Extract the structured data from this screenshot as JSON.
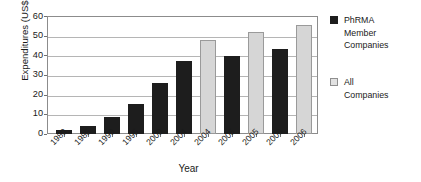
{
  "chart_data": {
    "type": "bar",
    "title": "",
    "xlabel": "Year",
    "ylabel": "Expenditures (US$ billions)",
    "ylim": [
      0,
      60
    ],
    "yticks": [
      0,
      10,
      20,
      30,
      40,
      50,
      60
    ],
    "grid": true,
    "legend_position": "right",
    "categories": [
      "1980",
      "1985",
      "1990",
      "1995",
      "2000",
      "2004",
      "2004",
      "2005",
      "2005",
      "2006",
      "2006"
    ],
    "values": [
      2.0,
      4.0,
      8.5,
      15.5,
      26.0,
      37.0,
      47.6,
      39.9,
      51.8,
      43.0,
      55.2
    ],
    "series_of_bar": [
      "PhRMA Member Companies",
      "PhRMA Member Companies",
      "PhRMA Member Companies",
      "PhRMA Member Companies",
      "PhRMA Member Companies",
      "PhRMA Member Companies",
      "All Companies",
      "PhRMA Member Companies",
      "All Companies",
      "PhRMA Member Companies",
      "All Companies"
    ],
    "series": [
      {
        "name": "PhRMA Member Companies",
        "color": "#1d1d1d",
        "points": [
          {
            "x": "1980",
            "y": 2.0
          },
          {
            "x": "1985",
            "y": 4.0
          },
          {
            "x": "1990",
            "y": 8.5
          },
          {
            "x": "1995",
            "y": 15.5
          },
          {
            "x": "2000",
            "y": 26.0
          },
          {
            "x": "2004",
            "y": 37.0
          },
          {
            "x": "2005",
            "y": 39.9
          },
          {
            "x": "2006",
            "y": 43.0
          }
        ]
      },
      {
        "name": "All Companies",
        "color": "#d6d6d6",
        "points": [
          {
            "x": "2004",
            "y": 47.6
          },
          {
            "x": "2005",
            "y": 51.8
          },
          {
            "x": "2006",
            "y": 55.2
          }
        ]
      }
    ]
  },
  "axes": {
    "y_title": "Expenditures (US$ billions)",
    "x_title": "Year",
    "y_ticks": [
      "0",
      "10",
      "20",
      "30",
      "40",
      "50",
      "60"
    ],
    "x_ticks": [
      "1980",
      "1985",
      "1990",
      "1995",
      "2000",
      "2004",
      "2004",
      "2005",
      "2005",
      "2006",
      "2006"
    ]
  },
  "legend": {
    "items": [
      {
        "swatch": "black-square-icon",
        "line1": "PhRMA",
        "line2": "Member",
        "line3": "Companies"
      },
      {
        "swatch": "gray-square-icon",
        "line1": "All",
        "line2": "Companies",
        "line3": ""
      }
    ]
  }
}
